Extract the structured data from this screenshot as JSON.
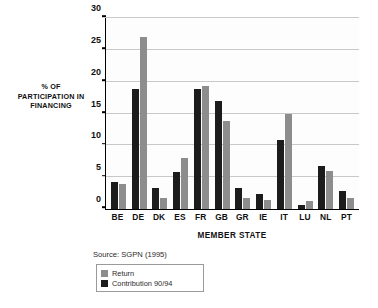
{
  "chart_data": {
    "type": "bar",
    "title": "",
    "xlabel": "MEMBER STATE",
    "ylabel": "% OF PARTICIPATION IN FINANCING",
    "ylim": [
      0,
      30
    ],
    "yticks": [
      0,
      5,
      10,
      15,
      20,
      25,
      30
    ],
    "grid": true,
    "legend_position": "bottom-left",
    "categories": [
      "BE",
      "DE",
      "DK",
      "ES",
      "FR",
      "GB",
      "GR",
      "IE",
      "IT",
      "LU",
      "NL",
      "PT"
    ],
    "series": [
      {
        "name": "Contribution 90/94",
        "color": "#1c1c1c",
        "values": [
          4.3,
          18.9,
          3.3,
          5.8,
          18.8,
          16.9,
          3.3,
          2.3,
          10.8,
          0.7,
          6.8,
          2.8
        ]
      },
      {
        "name": "Return",
        "color": "#8d8d8d",
        "values": [
          3.9,
          27.0,
          1.8,
          8.0,
          19.4,
          13.9,
          1.8,
          1.4,
          14.9,
          1.3,
          5.9,
          1.8
        ]
      }
    ],
    "annotations": {
      "source": "Source: SGPN (1995)"
    }
  },
  "axis": {
    "y_title_lines": [
      "% OF",
      "PARTICIPATION IN",
      "FINANCING"
    ]
  },
  "legend": {
    "items": [
      {
        "label": "Return",
        "swatch": "return"
      },
      {
        "label": "Contribution 90/94",
        "swatch": "contribution"
      }
    ]
  }
}
